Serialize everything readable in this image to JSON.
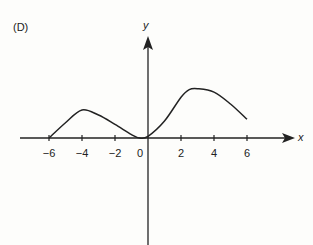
{
  "panel_label": "(D)",
  "chart_data": {
    "type": "line",
    "title": "",
    "xlabel": "x",
    "ylabel": "y",
    "x_ticks": [
      -6,
      -4,
      -2,
      0,
      2,
      4,
      6
    ],
    "x_tick_labels": [
      "-6",
      "-4",
      "-2",
      "0",
      "2",
      "4",
      "6"
    ],
    "y_ticks": [],
    "grid": false,
    "legend": null,
    "xlim": [
      -7.5,
      8.7
    ],
    "series": [
      {
        "name": "curve",
        "x": [
          -6,
          -5,
          -4,
          -3,
          -2,
          -1,
          -0.5,
          0,
          1,
          2,
          2.5,
          3,
          4,
          5,
          6
        ],
        "y": [
          0,
          0.9,
          1.65,
          1.35,
          0.8,
          0.2,
          0.0,
          0.1,
          1.0,
          2.4,
          2.85,
          2.9,
          2.7,
          2.0,
          1.1
        ]
      }
    ]
  },
  "axes": {
    "x_label": "x",
    "y_label": "y"
  }
}
